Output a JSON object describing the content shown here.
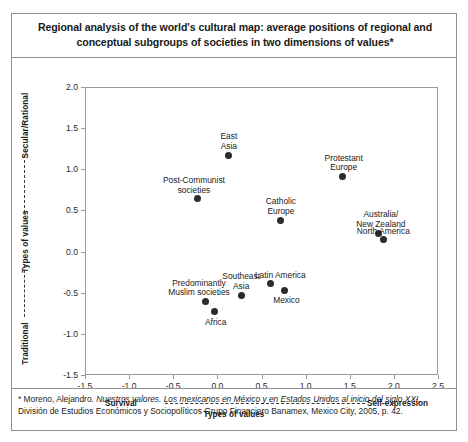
{
  "title": {
    "line1": "Regional analysis of the world's cultural map: average positions of regional and",
    "line2": "conceptual subgroups of societies in two dimensions of values*"
  },
  "axes": {
    "y_title": "Types of values",
    "y_top_label": "Secular/Rational",
    "y_bottom_label": "Traditional",
    "x_title": "Types of values",
    "x_left_label": "Survival",
    "x_right_label": "Self-expression"
  },
  "footnote": {
    "prefix": "* Moreno, Alejandro. ",
    "italic_title": "Nuestros valores. Los mexicanos en México y en Estados Unidos al inicio del siglo XXI.",
    "rest": "División de Estudios Económicos y Sociopolíticos Grupo Financiero Banamex, Mexico City, 2005, p. 42."
  },
  "chart_data": {
    "type": "scatter",
    "title": "Regional analysis of the world's cultural map: average positions of regional and conceptual subgroups of societies in two dimensions of values*",
    "xlabel": "Types of values",
    "ylabel": "Types of values",
    "xlim": [
      -1.5,
      2.5
    ],
    "ylim": [
      -1.5,
      2.0
    ],
    "xticks": [
      -1.5,
      -1.0,
      -0.5,
      0.0,
      0.5,
      1.0,
      1.5,
      2.0,
      2.5
    ],
    "yticks": [
      -1.5,
      -1.0,
      -0.5,
      0.0,
      0.5,
      1.0,
      1.5,
      2.0
    ],
    "xticklabels": [
      "-1.5",
      "-1.0",
      "-0.5",
      "0.0",
      "0.5",
      "1.0",
      "1.5",
      "2.0",
      "2.5"
    ],
    "yticklabels": [
      "-1.5",
      "-1.0",
      "-0.5",
      "0.0",
      "0.5",
      "1.0",
      "1.5",
      "2.0"
    ],
    "x_axis_poles": [
      "Survival",
      "Self-expression"
    ],
    "y_axis_poles": [
      "Traditional",
      "Secular/Rational"
    ],
    "grid": false,
    "legend": "none",
    "marker_color": "#2b2b2b",
    "points": [
      {
        "label": "East\nAsia",
        "x": 0.13,
        "y": 1.17,
        "lx": 0,
        "ly": -23
      },
      {
        "label": "Post-Communist\nsocieties",
        "x": -0.22,
        "y": 0.64,
        "lx": -4,
        "ly": -23
      },
      {
        "label": "Protestant\nEurope",
        "x": 1.42,
        "y": 0.91,
        "lx": 1,
        "ly": -23
      },
      {
        "label": "Catholic\nEurope",
        "x": 0.72,
        "y": 0.38,
        "lx": 0,
        "ly": -23
      },
      {
        "label": "Australia/\nNew Zealand",
        "x": 1.83,
        "y": 0.22,
        "lx": 2,
        "ly": -23
      },
      {
        "label": "North America",
        "x": 1.88,
        "y": 0.15,
        "lx": 0,
        "ly": -12
      },
      {
        "label": "Predominantly\nMuslim societies",
        "x": -0.14,
        "y": -0.61,
        "lx": -6,
        "ly": -23
      },
      {
        "label": "Africa",
        "x": -0.03,
        "y": -0.73,
        "lx": 1,
        "ly": 6
      },
      {
        "label": "Southeast\nAsia",
        "x": 0.27,
        "y": -0.53,
        "lx": 0,
        "ly": -23
      },
      {
        "label": "Latin America",
        "x": 0.6,
        "y": -0.39,
        "lx": 10,
        "ly": -13
      },
      {
        "label": "Mexico",
        "x": 0.76,
        "y": -0.47,
        "lx": 2,
        "ly": 6
      }
    ]
  }
}
